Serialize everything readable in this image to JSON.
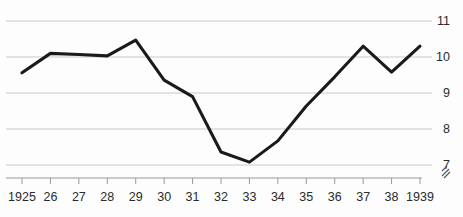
{
  "chart_data": {
    "type": "line",
    "title": "",
    "subtitle": "",
    "xlabel": "",
    "ylabel": "",
    "x": [
      1925,
      1926,
      1927,
      1928,
      1929,
      1930,
      1931,
      1932,
      1933,
      1934,
      1935,
      1936,
      1937,
      1938,
      1939
    ],
    "categories": [
      "1925",
      "26",
      "27",
      "28",
      "29",
      "30",
      "31",
      "32",
      "33",
      "34",
      "35",
      "36",
      "37",
      "38",
      "1939"
    ],
    "values": [
      9.56,
      10.1,
      10.07,
      10.03,
      10.47,
      9.36,
      8.9,
      7.36,
      7.08,
      7.67,
      8.64,
      9.45,
      10.3,
      9.58,
      10.3
    ],
    "series": [
      {
        "name": "series-1",
        "values": [
          9.56,
          10.1,
          10.07,
          10.03,
          10.47,
          9.36,
          8.9,
          7.36,
          7.08,
          7.67,
          8.64,
          9.45,
          10.3,
          9.58,
          10.3
        ],
        "color": "#1a1a1a"
      }
    ],
    "ylim": [
      6.6,
      11.25
    ],
    "yticks": [
      7,
      8,
      9,
      10,
      11
    ],
    "ytick_labels": [
      "7",
      "8",
      "9",
      "10",
      "11"
    ],
    "xlim": [
      1925,
      1939
    ],
    "grid": "horizontal",
    "y_axis_position": "right",
    "legend": "none",
    "axis_break": true,
    "annotations": []
  },
  "colors": {
    "line": "#1a1a1a",
    "grid": "#c9c9c9",
    "axis": "#9a9a9a",
    "text": "#2b2b2b",
    "background": "#fdfdfd"
  }
}
